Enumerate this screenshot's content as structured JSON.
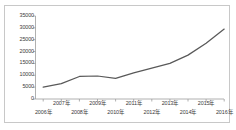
{
  "chart_data": {
    "type": "line",
    "title": "",
    "subtitle": "",
    "xlabel": "",
    "ylabel": "",
    "categories": [
      "2006年",
      "2007年",
      "2008年",
      "2009年",
      "2010年",
      "2011年",
      "2012年",
      "2013年",
      "2014年",
      "2015年",
      "2016年"
    ],
    "series": [
      {
        "name": "",
        "values": [
          5000,
          6500,
          9500,
          9700,
          8700,
          11000,
          13000,
          15000,
          18500,
          23500,
          29500
        ]
      }
    ],
    "y_ticks": [
      0,
      5000,
      10000,
      15000,
      20000,
      25000,
      30000,
      35000
    ],
    "y_tick_labels": [
      "0",
      "5000",
      "10000",
      "15000",
      "20000",
      "25000",
      "30000",
      "35000"
    ],
    "ylim": [
      0,
      35000
    ],
    "x_tick_labels_upper": [
      "2007年",
      "2009年",
      "2011年",
      "2013年",
      "2015年"
    ],
    "x_tick_labels_lower": [
      "2006年",
      "2008年",
      "2010年",
      "2012年",
      "2014年",
      "2016年"
    ],
    "grid": false,
    "legend": "none",
    "line_color": "#595959",
    "axis_color": "#9c9c9c",
    "text_color": "#3a3a3a",
    "border_color": "#c8c8c8",
    "background_color": "#ffffff"
  }
}
